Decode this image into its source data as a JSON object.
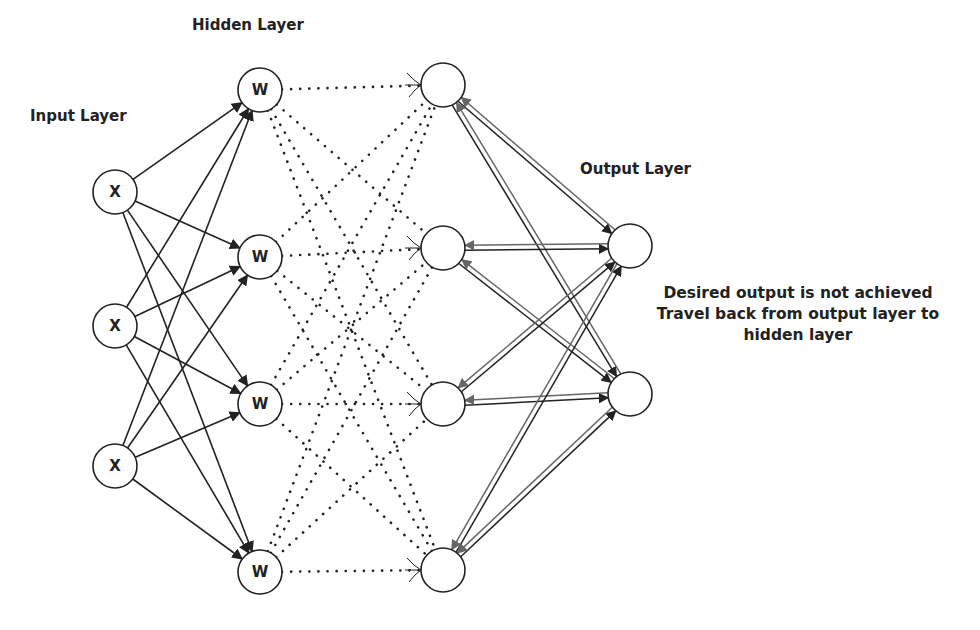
{
  "labels": {
    "input_layer": "Input Layer",
    "hidden_layer": "Hidden Layer",
    "output_layer": "Output Layer",
    "note": "Desired output is not achieved Travel back from output layer to hidden layer"
  },
  "nodes": {
    "input": [
      {
        "label": "X",
        "x": 115,
        "y": 192
      },
      {
        "label": "X",
        "x": 115,
        "y": 326
      },
      {
        "label": "X",
        "x": 115,
        "y": 466
      }
    ],
    "hidden": [
      {
        "label": "W",
        "x": 260,
        "y": 90
      },
      {
        "label": "W",
        "x": 260,
        "y": 257
      },
      {
        "label": "W",
        "x": 260,
        "y": 404
      },
      {
        "label": "W",
        "x": 260,
        "y": 572
      }
    ],
    "hidden2": [
      {
        "label": "",
        "x": 443,
        "y": 85
      },
      {
        "label": "",
        "x": 443,
        "y": 248
      },
      {
        "label": "",
        "x": 443,
        "y": 404
      },
      {
        "label": "",
        "x": 443,
        "y": 570
      }
    ],
    "output": [
      {
        "label": "",
        "x": 630,
        "y": 246
      },
      {
        "label": "",
        "x": 630,
        "y": 394
      }
    ]
  },
  "colors": {
    "stroke": "#222222",
    "backprop": "#666666",
    "background": "#ffffff"
  }
}
